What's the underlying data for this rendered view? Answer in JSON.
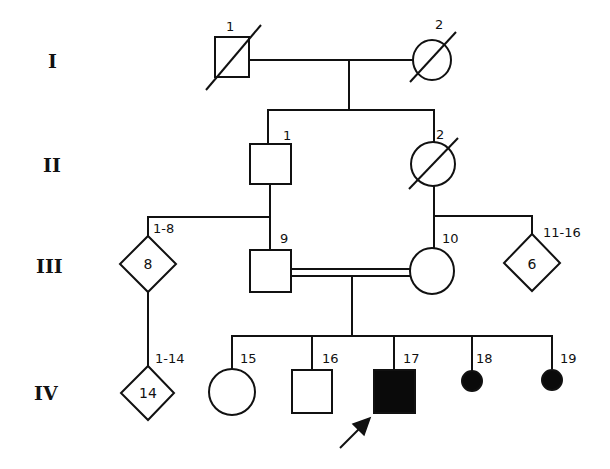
{
  "diagram": {
    "type": "pedigree",
    "generations": [
      {
        "label": "I"
      },
      {
        "label": "II"
      },
      {
        "label": "III"
      },
      {
        "label": "IV"
      }
    ],
    "individuals": {
      "I_1": {
        "id": "1",
        "sex": "male",
        "status": "deceased"
      },
      "I_2": {
        "id": "2",
        "sex": "female",
        "status": "deceased"
      },
      "II_1": {
        "id": "1",
        "sex": "male",
        "status": "unaffected"
      },
      "II_2": {
        "id": "2",
        "sex": "female",
        "status": "deceased"
      },
      "III_8": {
        "id": "1-8",
        "sex": "unknown",
        "count": "8",
        "status": "unaffected"
      },
      "III_9": {
        "id": "9",
        "sex": "male",
        "status": "unaffected"
      },
      "III_10": {
        "id": "10",
        "sex": "female",
        "status": "unaffected"
      },
      "III_6": {
        "id": "11-16",
        "sex": "unknown",
        "count": "6",
        "status": "unaffected"
      },
      "IV_14": {
        "id": "1-14",
        "sex": "unknown",
        "count": "14",
        "status": "unaffected"
      },
      "IV_15": {
        "id": "15",
        "sex": "female",
        "status": "unaffected"
      },
      "IV_16": {
        "id": "16",
        "sex": "male",
        "status": "unaffected"
      },
      "IV_17": {
        "id": "17",
        "sex": "male",
        "status": "affected",
        "proband": true
      },
      "IV_18": {
        "id": "18",
        "sex": "female",
        "status": "affected",
        "note": "small filled circle"
      },
      "IV_19": {
        "id": "19",
        "sex": "female",
        "status": "affected",
        "note": "small filled circle"
      }
    },
    "relationships": [
      {
        "type": "mating",
        "partners": [
          "I_1",
          "I_2"
        ],
        "children": [
          "II_1",
          "II_2"
        ]
      },
      {
        "type": "mating",
        "partners": [
          "II_1",
          "unshown"
        ],
        "children": [
          "III_8",
          "III_9"
        ]
      },
      {
        "type": "mating",
        "partners": [
          "II_2",
          "unshown"
        ],
        "children": [
          "III_10",
          "III_6"
        ]
      },
      {
        "type": "consanguineous",
        "partners": [
          "III_9",
          "III_10"
        ],
        "children": [
          "IV_15",
          "IV_16",
          "IV_17",
          "IV_18",
          "IV_19"
        ]
      },
      {
        "type": "descent",
        "parent": "III_8",
        "children": [
          "IV_14"
        ]
      }
    ],
    "proband_marker": "arrow pointing to IV-17",
    "colors": {
      "line": "#111111",
      "affected_fill": "#0a0a0a",
      "background": "#ffffff"
    }
  }
}
